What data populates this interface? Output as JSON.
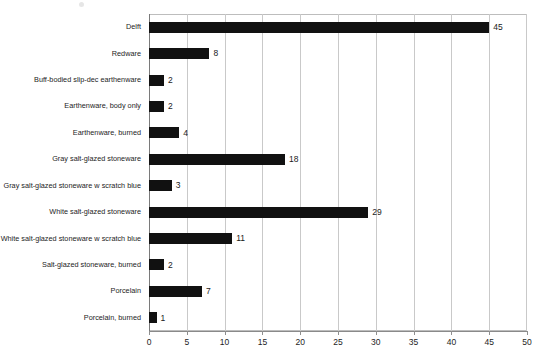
{
  "chart_data": {
    "type": "bar",
    "orientation": "horizontal",
    "title": "",
    "subtitle": "",
    "xlabel": "",
    "ylabel": "",
    "xlim": [
      0,
      50
    ],
    "xticks": [
      0,
      5,
      10,
      15,
      20,
      25,
      30,
      35,
      40,
      45,
      50
    ],
    "grid": "vertical",
    "legend": "none",
    "bar_color": "#111111",
    "categories": [
      "Delft",
      "Redware",
      "Buff-bodied slip-dec earthenware",
      "Earthenware, body only",
      "Earthenware, burned",
      "Gray salt-glazed stoneware",
      "Gray salt-glazed stoneware w scratch blue",
      "White salt-glazed stoneware",
      "White salt-glazed stoneware w scratch blue",
      "Salt-glazed stoneware, burned",
      "Porcelain",
      "Porcelain, burned"
    ],
    "values": [
      45,
      8,
      2,
      2,
      4,
      18,
      3,
      29,
      11,
      2,
      7,
      1
    ],
    "value_labels": [
      "45",
      "8",
      "2",
      "2",
      "4",
      "18",
      "3",
      "29",
      "11",
      "2",
      "7",
      "1"
    ]
  }
}
